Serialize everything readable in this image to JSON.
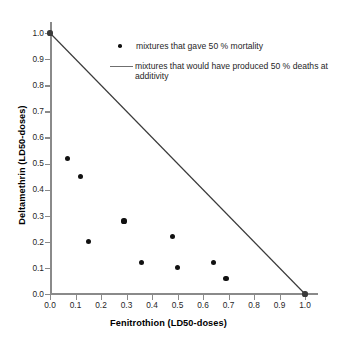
{
  "chart_data": {
    "type": "scatter",
    "title": "",
    "xlabel": "Fenitrothion (LD50-doses)",
    "ylabel": "Deltamethrin (LD50-doses)",
    "xlim": [
      0.0,
      1.0
    ],
    "ylim": [
      0.0,
      1.0
    ],
    "grid": false,
    "legend_position": "inside-upper-right",
    "xticks": [
      "0.0",
      "0.1",
      "0.2",
      "0.3",
      "0.4",
      "0.5",
      "0.6",
      "0.7",
      "0.8",
      "0.9",
      "1.0"
    ],
    "xtick_values": [
      0.0,
      0.1,
      0.2,
      0.3,
      0.4,
      0.5,
      0.6,
      0.7,
      0.8,
      0.9,
      1.0
    ],
    "yticks": [
      "0.0",
      "0.1",
      "0.2",
      "0.3",
      "0.4",
      "0.5",
      "0.6",
      "0.7",
      "0.8",
      "0.9",
      "1.0"
    ],
    "ytick_values": [
      0.0,
      0.1,
      0.2,
      0.3,
      0.4,
      0.5,
      0.6,
      0.7,
      0.8,
      0.9,
      1.0
    ],
    "series": [
      {
        "name": "mixtures that gave 50 % mortality",
        "type": "scatter",
        "marker": "filled-circle",
        "color": "#111111",
        "points": [
          {
            "x": 0.07,
            "y": 0.52
          },
          {
            "x": 0.12,
            "y": 0.45
          },
          {
            "x": 0.15,
            "y": 0.2
          },
          {
            "x": 0.29,
            "y": 0.28
          },
          {
            "x": 0.36,
            "y": 0.12
          },
          {
            "x": 0.48,
            "y": 0.22
          },
          {
            "x": 0.5,
            "y": 0.1
          },
          {
            "x": 0.64,
            "y": 0.12
          },
          {
            "x": 0.69,
            "y": 0.06
          }
        ]
      },
      {
        "name": "mixtures that would have produced 50 % deaths at additivity",
        "type": "line",
        "color": "#3a3a3a",
        "points": [
          {
            "x": 0.0,
            "y": 1.0
          },
          {
            "x": 1.0,
            "y": 0.0
          }
        ],
        "endpoint_markers": [
          {
            "x": 0.0,
            "y": 1.0
          },
          {
            "x": 1.0,
            "y": 0.0
          }
        ]
      }
    ]
  },
  "legend": {
    "items": [
      {
        "key": "marker",
        "label": "mixtures that gave 50 % mortality"
      },
      {
        "key": "line",
        "label": "mixtures that would have produced 50 % deaths at additivity"
      }
    ]
  },
  "colors": {
    "axis": "#8a8a8a",
    "marker": "#111111",
    "line": "#3a3a3a",
    "text": "#1f1f1f",
    "background": "#ffffff"
  }
}
